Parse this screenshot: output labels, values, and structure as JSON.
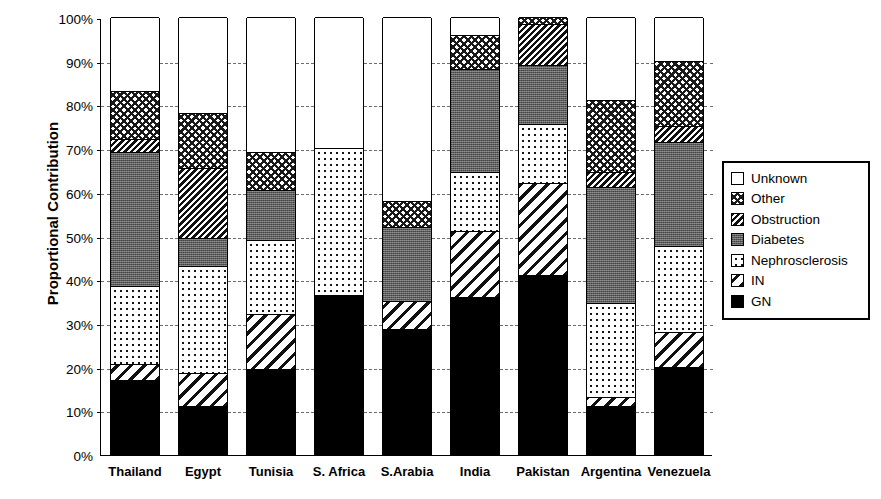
{
  "chart_data": {
    "type": "bar",
    "subtype": "stacked-bar-100-percent",
    "title": "",
    "xlabel": "",
    "ylabel": "Proportional Contribution",
    "ylim": [
      0,
      100
    ],
    "ytick_labels": [
      "0%",
      "10%",
      "20%",
      "30%",
      "40%",
      "50%",
      "60%",
      "70%",
      "80%",
      "90%",
      "100%"
    ],
    "ytick_values": [
      0,
      10,
      20,
      30,
      40,
      50,
      60,
      70,
      80,
      90,
      100
    ],
    "grid": "horizontal-dashed",
    "legend_position": "right",
    "categories": [
      "Thailand",
      "Egypt",
      "Tunisia",
      "S. Africa",
      "S.Arabia",
      "India",
      "Pakistan",
      "Argentina",
      "Venezuela"
    ],
    "series": [
      {
        "name": "GN",
        "pattern": "solid-black",
        "values": [
          17.0,
          11.0,
          19.5,
          36.5,
          28.5,
          36.0,
          41.0,
          11.0,
          20.0
        ]
      },
      {
        "name": "IN",
        "pattern": "diagonal-wide",
        "values": [
          3.5,
          7.5,
          12.5,
          0.0,
          6.5,
          15.0,
          21.0,
          2.0,
          8.0
        ]
      },
      {
        "name": "Nephrosclerosis",
        "pattern": "dotted",
        "values": [
          18.0,
          24.5,
          17.0,
          33.5,
          0.0,
          13.5,
          13.5,
          21.5,
          19.5
        ]
      },
      {
        "name": "Diabetes",
        "pattern": "gray-stipple",
        "values": [
          30.5,
          6.5,
          11.5,
          0.0,
          17.0,
          23.5,
          13.5,
          26.5,
          24.0
        ]
      },
      {
        "name": "Obstruction",
        "pattern": "diagonal-dense",
        "values": [
          3.0,
          16.0,
          0.0,
          0.0,
          0.0,
          0.0,
          9.5,
          3.5,
          3.5
        ]
      },
      {
        "name": "Other",
        "pattern": "crosshatch",
        "values": [
          11.0,
          12.5,
          8.5,
          0.0,
          6.0,
          8.0,
          1.5,
          16.5,
          15.0
        ]
      },
      {
        "name": "Unknown",
        "pattern": "white",
        "values": [
          17.0,
          22.0,
          31.0,
          30.0,
          42.0,
          4.0,
          0.0,
          19.0,
          10.0
        ]
      }
    ],
    "cumulative_tops": {
      "Thailand": {
        "GN": 17.0,
        "IN": 20.5,
        "Nephrosclerosis": 38.5,
        "Diabetes": 69.0,
        "Obstruction": 72.0,
        "Other": 83.0,
        "Unknown": 100.0
      },
      "Egypt": {
        "GN": 11.0,
        "IN": 18.5,
        "Nephrosclerosis": 43.0,
        "Diabetes": 49.5,
        "Obstruction": 65.5,
        "Other": 78.0,
        "Unknown": 100.0
      },
      "Tunisia": {
        "GN": 19.5,
        "IN": 32.0,
        "Nephrosclerosis": 49.0,
        "Diabetes": 60.5,
        "Obstruction": 60.5,
        "Other": 69.0,
        "Unknown": 100.0
      },
      "S. Africa": {
        "GN": 36.5,
        "IN": 36.5,
        "Nephrosclerosis": 70.0,
        "Diabetes": 70.0,
        "Obstruction": 70.0,
        "Other": 70.0,
        "Unknown": 100.0
      },
      "S.Arabia": {
        "GN": 28.5,
        "IN": 35.0,
        "Nephrosclerosis": 35.0,
        "Diabetes": 52.0,
        "Obstruction": 52.0,
        "Other": 58.0,
        "Unknown": 100.0
      },
      "India": {
        "GN": 36.0,
        "IN": 51.0,
        "Nephrosclerosis": 64.5,
        "Diabetes": 88.0,
        "Obstruction": 88.0,
        "Other": 96.0,
        "Unknown": 100.0
      },
      "Pakistan": {
        "GN": 41.0,
        "IN": 62.0,
        "Nephrosclerosis": 75.5,
        "Diabetes": 89.0,
        "Obstruction": 98.5,
        "Other": 100.0,
        "Unknown": 100.0
      },
      "Argentina": {
        "GN": 11.0,
        "IN": 13.0,
        "Nephrosclerosis": 34.5,
        "Diabetes": 61.0,
        "Obstruction": 64.5,
        "Other": 81.0,
        "Unknown": 100.0
      },
      "Venezuela": {
        "GN": 20.0,
        "IN": 28.0,
        "Nephrosclerosis": 47.5,
        "Diabetes": 71.5,
        "Obstruction": 75.0,
        "Other": 90.0,
        "Unknown": 100.0
      }
    }
  },
  "legend": {
    "entries": [
      {
        "label": "Unknown",
        "fill_class": "fill-unknown"
      },
      {
        "label": "Other",
        "fill_class": "fill-other"
      },
      {
        "label": "Obstruction",
        "fill_class": "fill-obstruction"
      },
      {
        "label": "Diabetes",
        "fill_class": "fill-diabetes"
      },
      {
        "label": "Nephrosclerosis",
        "fill_class": "fill-nephro"
      },
      {
        "label": "IN",
        "fill_class": "fill-in"
      },
      {
        "label": "GN",
        "fill_class": "fill-gn"
      }
    ]
  },
  "style": {
    "axis_color": "#000000",
    "grid_color": "#6d6d6d",
    "background": "#ffffff",
    "diabetes_gray": "#5d5d5d"
  }
}
